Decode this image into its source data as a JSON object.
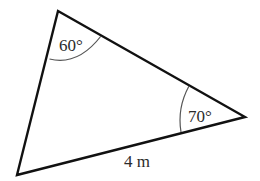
{
  "diagram": {
    "type": "triangle",
    "vertices": {
      "top": {
        "x": 58,
        "y": 11
      },
      "right": {
        "x": 245,
        "y": 117
      },
      "bottom_left": {
        "x": 17,
        "y": 175
      }
    },
    "angles": [
      {
        "vertex": "top",
        "label": "60°"
      },
      {
        "vertex": "right",
        "label": "70°"
      }
    ],
    "sides": [
      {
        "between": [
          "bottom_left",
          "right"
        ],
        "label": "4 m"
      }
    ],
    "colors": {
      "stroke": "#111111",
      "arc": "#555555",
      "text": "#2b2b2b",
      "background": "#ffffff"
    }
  }
}
